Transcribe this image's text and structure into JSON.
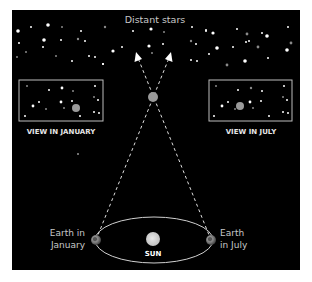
{
  "title": "Distant stars",
  "panel": {
    "bg": "#000000",
    "x": 12,
    "y": 10,
    "w": 288,
    "h": 260
  },
  "views": {
    "january": {
      "label": "VIEW IN JANUARY",
      "box": {
        "x": 19,
        "y": 80,
        "w": 84,
        "h": 41
      },
      "near_star": {
        "x": 76,
        "y": 108
      }
    },
    "july": {
      "label": "VIEW IN JULY",
      "box": {
        "x": 209,
        "y": 80,
        "w": 83,
        "h": 41
      },
      "near_star": {
        "x": 240,
        "y": 106
      }
    }
  },
  "orbit": {
    "sun": {
      "label": "SUN",
      "x": 153,
      "y": 239,
      "r": 7
    },
    "ellipse": {
      "cx": 154,
      "cy": 240,
      "rx": 59,
      "ry": 23
    },
    "earth_january": {
      "label_line1": "Earth in",
      "label_line2": "January",
      "x": 96,
      "y": 240
    },
    "earth_july": {
      "label_line1": "Earth",
      "label_line2": "in July",
      "x": 211,
      "y": 240
    }
  },
  "nearby_star": {
    "x": 153,
    "y": 97,
    "r": 5
  },
  "sightlines": {
    "from_january": {
      "x1": 96,
      "y1": 240,
      "x2": 171,
      "y2": 54
    },
    "from_july": {
      "x1": 211,
      "y1": 240,
      "x2": 136,
      "y2": 54
    }
  },
  "colors": {
    "star_bright": "#ffffff",
    "star_dim": "#8a8a8a",
    "near_star": "#9a9a9a",
    "lines": "#e0e0e0",
    "box_border": "#bdbdbd"
  },
  "background_stars": [
    [
      18,
      31,
      1.8,
      1
    ],
    [
      31,
      27,
      1,
      1
    ],
    [
      48,
      25,
      1.8,
      1
    ],
    [
      62,
      27,
      1,
      0
    ],
    [
      81,
      31,
      1,
      1
    ],
    [
      105,
      27,
      1.2,
      0
    ],
    [
      19,
      43,
      1,
      1
    ],
    [
      44,
      40,
      1.8,
      1
    ],
    [
      61,
      40,
      1,
      1
    ],
    [
      78,
      39,
      1.2,
      0
    ],
    [
      85,
      41,
      1,
      1
    ],
    [
      43,
      47,
      1,
      1
    ],
    [
      17,
      57,
      1,
      0
    ],
    [
      26,
      52,
      1,
      0
    ],
    [
      56,
      56,
      1,
      0
    ],
    [
      72,
      61,
      1,
      1
    ],
    [
      89,
      56,
      1,
      1
    ],
    [
      95,
      57,
      1,
      1
    ],
    [
      103,
      64,
      1,
      1
    ],
    [
      133,
      31,
      1,
      1
    ],
    [
      151,
      29,
      1.6,
      1
    ],
    [
      164,
      32,
      1,
      0
    ],
    [
      113,
      51,
      1.6,
      1
    ],
    [
      122,
      47,
      1,
      1
    ],
    [
      149,
      46,
      1.6,
      1
    ],
    [
      163,
      44,
      1,
      1
    ],
    [
      152,
      53,
      1,
      0
    ],
    [
      191,
      41,
      1.2,
      0
    ],
    [
      192,
      27,
      1,
      1
    ],
    [
      206,
      31,
      1,
      1
    ],
    [
      196,
      44,
      1,
      1
    ],
    [
      191,
      60,
      1,
      1
    ],
    [
      197,
      61,
      1,
      1
    ],
    [
      103,
      64,
      1,
      1
    ],
    [
      206,
      30,
      1,
      1
    ],
    [
      213,
      33,
      1.6,
      1
    ],
    [
      237,
      29,
      1,
      1
    ],
    [
      247,
      34,
      1.4,
      0
    ],
    [
      262,
      33,
      1,
      1
    ],
    [
      267,
      36,
      1.8,
      1
    ],
    [
      288,
      27,
      1,
      1
    ],
    [
      217,
      48,
      1.8,
      1
    ],
    [
      233,
      47,
      1,
      1
    ],
    [
      246,
      42,
      1,
      1
    ],
    [
      249,
      41,
      1,
      1
    ],
    [
      258,
      47,
      1.4,
      0
    ],
    [
      291,
      43,
      1.4,
      0
    ],
    [
      287,
      50,
      1.8,
      1
    ],
    [
      209,
      54,
      1,
      1
    ],
    [
      227,
      65,
      1.4,
      0
    ],
    [
      245,
      61,
      1.8,
      1
    ],
    [
      268,
      58,
      1,
      1
    ],
    [
      78,
      154,
      0.8,
      1
    ]
  ],
  "box_stars_january": [
    [
      27,
      86,
      1,
      0
    ],
    [
      49,
      90,
      1,
      1
    ],
    [
      62,
      88,
      1.4,
      1
    ],
    [
      73,
      91,
      1,
      0
    ],
    [
      95,
      86,
      1,
      1
    ],
    [
      39,
      102,
      1,
      1
    ],
    [
      33,
      106,
      1.4,
      1
    ],
    [
      61,
      102,
      1.4,
      1
    ],
    [
      72,
      101,
      1,
      1
    ],
    [
      46,
      109,
      1,
      0
    ],
    [
      64,
      108,
      1,
      0
    ],
    [
      94,
      97,
      1,
      0
    ],
    [
      98,
      100,
      1,
      1
    ],
    [
      94,
      112,
      1,
      1
    ],
    [
      99,
      113,
      1,
      1
    ],
    [
      25,
      116,
      1,
      1
    ],
    [
      80,
      116,
      1,
      1
    ]
  ],
  "box_stars_july": [
    [
      216,
      86,
      1,
      0
    ],
    [
      238,
      90,
      1,
      1
    ],
    [
      251,
      88,
      1.2,
      0
    ],
    [
      262,
      91,
      1,
      1
    ],
    [
      284,
      86,
      1,
      1
    ],
    [
      228,
      102,
      1,
      1
    ],
    [
      222,
      106,
      1.4,
      1
    ],
    [
      250,
      102,
      1.4,
      1
    ],
    [
      261,
      101,
      1,
      1
    ],
    [
      235,
      109,
      1,
      0
    ],
    [
      253,
      108,
      1,
      0
    ],
    [
      283,
      97,
      1,
      0
    ],
    [
      287,
      100,
      1,
      1
    ],
    [
      283,
      112,
      1,
      1
    ],
    [
      288,
      113,
      1,
      1
    ],
    [
      214,
      116,
      1,
      1
    ],
    [
      269,
      116,
      1,
      1
    ]
  ]
}
